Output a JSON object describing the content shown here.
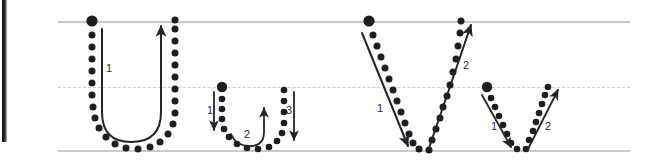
{
  "worksheet": {
    "title": "Letter formation practice: U u V v",
    "background_color": "#ffffff",
    "dot_color": "#1d1d24",
    "stroke_color": "#232329",
    "guide_line_color": "#c9c9c9",
    "midline_color": "#cdcdcd",
    "binding_color": "#15151a"
  },
  "guides": {
    "top_line": {
      "label": "top-line",
      "y": 21
    },
    "mid_line": {
      "label": "mid-dashed-line",
      "y": 87,
      "style": "dashed"
    },
    "bottom_line": {
      "label": "baseline",
      "y": 150
    }
  },
  "letters": [
    {
      "id": "uppercase-u",
      "character": "U",
      "case": "uppercase",
      "start_dot": {
        "x": 92,
        "y": 21
      },
      "stroke_count": 1,
      "strokes": [
        {
          "number": "1",
          "label_x": 106,
          "label_y": 63,
          "direction": "down-curve-up"
        }
      ]
    },
    {
      "id": "lowercase-u",
      "character": "u",
      "case": "lowercase",
      "start_dot": {
        "x": 222,
        "y": 87
      },
      "stroke_count": 3,
      "strokes": [
        {
          "number": "1",
          "label_x": 209,
          "label_y": 110,
          "direction": "down"
        },
        {
          "number": "2",
          "label_x": 245,
          "label_y": 133,
          "direction": "curve-up"
        },
        {
          "number": "3",
          "label_x": 287,
          "label_y": 110,
          "direction": "down"
        }
      ]
    },
    {
      "id": "uppercase-v",
      "character": "V",
      "case": "uppercase",
      "start_dot": {
        "x": 369,
        "y": 21
      },
      "stroke_count": 2,
      "strokes": [
        {
          "number": "1",
          "label_x": 378,
          "label_y": 106,
          "direction": "down-right"
        },
        {
          "number": "2",
          "label_x": 462,
          "label_y": 63,
          "direction": "up-right"
        }
      ]
    },
    {
      "id": "lowercase-v",
      "character": "v",
      "case": "lowercase",
      "start_dot": {
        "x": 487,
        "y": 87
      },
      "stroke_count": 2,
      "strokes": [
        {
          "number": "1",
          "label_x": 492,
          "label_y": 125,
          "direction": "down-right"
        },
        {
          "number": "2",
          "label_x": 546,
          "label_y": 125,
          "direction": "up-right"
        }
      ]
    }
  ],
  "stroke_numbers": {
    "u_upper_1": "1",
    "u_lower_1": "1",
    "u_lower_2": "2",
    "u_lower_3": "3",
    "v_upper_1": "1",
    "v_upper_2": "2",
    "v_lower_1": "1",
    "v_lower_2": "2"
  }
}
